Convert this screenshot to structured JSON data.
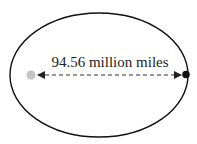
{
  "diagram": {
    "type": "orbit-ellipse",
    "distance_label": "94.56 million miles",
    "colors": {
      "orbit": "#111111",
      "sun": "#c4c4c4",
      "planet": "#111111",
      "arrow": "#333333",
      "background": "#ffffff"
    },
    "elements": {
      "orbit": "ellipse",
      "focus_body": "gray-dot",
      "orbiting_body": "black-dot",
      "distance_arrow": "double-headed-dashed-arrow"
    }
  }
}
